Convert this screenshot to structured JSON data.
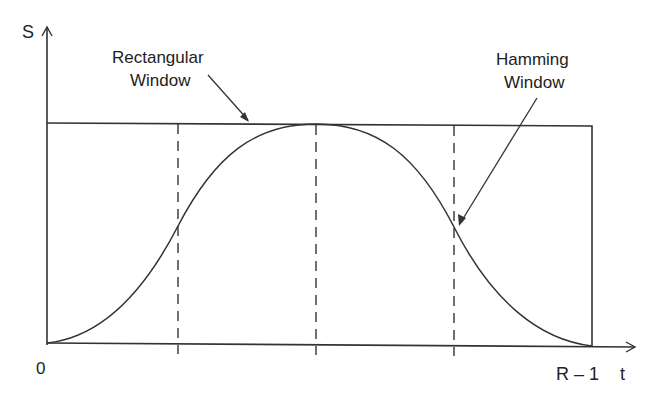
{
  "diagram": {
    "type": "window-function-comparison",
    "axes": {
      "y_label": "S",
      "x_label": "t",
      "x_start_label": "0",
      "x_end_label": "R – 1"
    },
    "annotations": {
      "rectangular": {
        "line1": "Rectangular",
        "line2": "Window"
      },
      "hamming": {
        "line1": "Hamming",
        "line2": "Window"
      }
    },
    "curves": [
      {
        "name": "Rectangular Window",
        "shape": "constant 1 over [0, R-1]"
      },
      {
        "name": "Hamming Window",
        "shape": "raised cosine from 0 to peak at center back to 0"
      }
    ],
    "dashed_markers": [
      "quarter",
      "half",
      "three-quarter"
    ],
    "colors": {
      "ink": "#222222",
      "background": "#ffffff"
    }
  }
}
